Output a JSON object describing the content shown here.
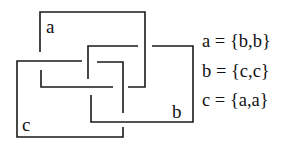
{
  "diagram": {
    "components": [
      {
        "id": "a",
        "label": "a"
      },
      {
        "id": "b",
        "label": "b"
      },
      {
        "id": "c",
        "label": "c"
      }
    ],
    "equations": [
      {
        "lhs": "a",
        "text": "a = {b,b}"
      },
      {
        "lhs": "b",
        "text": "b = {c,c}"
      },
      {
        "lhs": "c",
        "text": "c = {a,a}"
      }
    ],
    "stroke_color": "#1a1a1a",
    "background": "#ffffff"
  }
}
